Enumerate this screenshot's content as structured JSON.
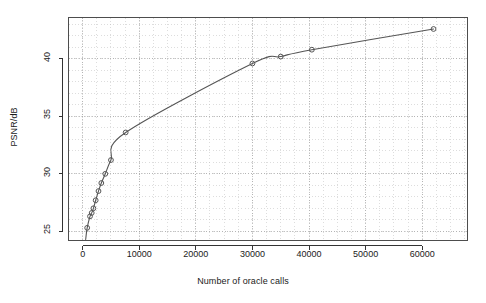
{
  "chart_data": {
    "type": "line",
    "title": "",
    "subtitle": "",
    "xlabel": "Number of oracle calls",
    "ylabel": "PSNR/dB",
    "xlim": [
      -2500,
      68000
    ],
    "ylim": [
      24.2,
      43.6
    ],
    "xticks": [
      0,
      10000,
      20000,
      30000,
      40000,
      50000,
      60000
    ],
    "xticklabels": [
      "0",
      "10000",
      "20000",
      "30000",
      "40000",
      "50000",
      "60000"
    ],
    "yticks": [
      25,
      30,
      35,
      40
    ],
    "yticklabels": [
      "25",
      "30",
      "35",
      "40"
    ],
    "grid": true,
    "grid_style": "dotted-minor",
    "legend": null,
    "legend_position": "none",
    "marker": "open-circle",
    "line_color": "#555555",
    "marker_color": "#555555",
    "grid_color": "#bbbbbb",
    "axis_color": "#4d4d4d",
    "background": "#ffffff",
    "series": [
      {
        "name": "PSNR vs oracle calls",
        "x": [
          800,
          1300,
          1600,
          1900,
          2300,
          2800,
          3300,
          4000,
          5000,
          7600,
          30000,
          35000,
          40500,
          62000
        ],
        "y": [
          25.3,
          26.3,
          26.6,
          27.0,
          27.7,
          28.5,
          29.2,
          30.0,
          31.2,
          33.6,
          39.6,
          40.2,
          40.8,
          42.6
        ]
      }
    ]
  }
}
